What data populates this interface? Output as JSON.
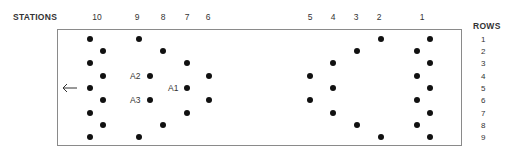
{
  "header": {
    "stations_label": "STATIONS",
    "rows_label": "ROWS"
  },
  "stations": [
    {
      "label": "10",
      "x": 97
    },
    {
      "label": "9",
      "x": 137
    },
    {
      "label": "8",
      "x": 163
    },
    {
      "label": "7",
      "x": 187
    },
    {
      "label": "6",
      "x": 208
    },
    {
      "label": "5",
      "x": 310
    },
    {
      "label": "4",
      "x": 333
    },
    {
      "label": "3",
      "x": 356
    },
    {
      "label": "2",
      "x": 379
    },
    {
      "label": "1",
      "x": 422
    }
  ],
  "rows": [
    {
      "label": "1",
      "y": 39
    },
    {
      "label": "2",
      "y": 51
    },
    {
      "label": "3",
      "y": 63
    },
    {
      "label": "4",
      "y": 76
    },
    {
      "label": "5",
      "y": 88
    },
    {
      "label": "6",
      "y": 100
    },
    {
      "label": "7",
      "y": 113
    },
    {
      "label": "8",
      "y": 125
    },
    {
      "label": "9",
      "y": 137
    }
  ],
  "annotations": [
    {
      "label": "A2",
      "x": 130,
      "y": 76
    },
    {
      "label": "A1",
      "x": 168,
      "y": 88
    },
    {
      "label": "A3",
      "x": 130,
      "y": 100
    }
  ],
  "arrow": {
    "icon": "left-arrow-icon",
    "glyph": "←"
  },
  "dots": [
    {
      "station": "10",
      "row": 1,
      "x": 90,
      "y": 39
    },
    {
      "station": "10",
      "row": 2,
      "x": 103,
      "y": 51
    },
    {
      "station": "10",
      "row": 3,
      "x": 90,
      "y": 63
    },
    {
      "station": "10",
      "row": 4,
      "x": 103,
      "y": 76
    },
    {
      "station": "10",
      "row": 5,
      "x": 90,
      "y": 88
    },
    {
      "station": "10",
      "row": 6,
      "x": 103,
      "y": 100
    },
    {
      "station": "10",
      "row": 7,
      "x": 90,
      "y": 113
    },
    {
      "station": "10",
      "row": 8,
      "x": 103,
      "y": 125
    },
    {
      "station": "10",
      "row": 9,
      "x": 90,
      "y": 137
    },
    {
      "station": "9",
      "row": 1,
      "x": 139,
      "y": 39
    },
    {
      "station": "9",
      "row": 9,
      "x": 139,
      "y": 137
    },
    {
      "station": "8",
      "row": 2,
      "x": 163,
      "y": 51
    },
    {
      "station": "8",
      "row": 4,
      "x": 150,
      "y": 76,
      "label": "A2"
    },
    {
      "station": "8",
      "row": 6,
      "x": 150,
      "y": 100,
      "label": "A3"
    },
    {
      "station": "8",
      "row": 8,
      "x": 163,
      "y": 125
    },
    {
      "station": "7",
      "row": 3,
      "x": 187,
      "y": 63
    },
    {
      "station": "7",
      "row": 5,
      "x": 187,
      "y": 88,
      "label": "A1"
    },
    {
      "station": "7",
      "row": 7,
      "x": 187,
      "y": 113
    },
    {
      "station": "6",
      "row": 4,
      "x": 209,
      "y": 76
    },
    {
      "station": "6",
      "row": 6,
      "x": 209,
      "y": 100
    },
    {
      "station": "5",
      "row": 4,
      "x": 310,
      "y": 76
    },
    {
      "station": "5",
      "row": 6,
      "x": 310,
      "y": 100
    },
    {
      "station": "4",
      "row": 3,
      "x": 333,
      "y": 63
    },
    {
      "station": "4",
      "row": 5,
      "x": 333,
      "y": 88
    },
    {
      "station": "4",
      "row": 7,
      "x": 333,
      "y": 113
    },
    {
      "station": "3",
      "row": 2,
      "x": 357,
      "y": 51
    },
    {
      "station": "3",
      "row": 8,
      "x": 357,
      "y": 125
    },
    {
      "station": "2",
      "row": 1,
      "x": 381,
      "y": 39
    },
    {
      "station": "2",
      "row": 9,
      "x": 381,
      "y": 137
    },
    {
      "station": "1",
      "row": 1,
      "x": 430,
      "y": 39
    },
    {
      "station": "1",
      "row": 2,
      "x": 417,
      "y": 51
    },
    {
      "station": "1",
      "row": 3,
      "x": 430,
      "y": 63
    },
    {
      "station": "1",
      "row": 4,
      "x": 417,
      "y": 76
    },
    {
      "station": "1",
      "row": 5,
      "x": 430,
      "y": 88
    },
    {
      "station": "1",
      "row": 6,
      "x": 417,
      "y": 100
    },
    {
      "station": "1",
      "row": 7,
      "x": 430,
      "y": 113
    },
    {
      "station": "1",
      "row": 8,
      "x": 417,
      "y": 125
    },
    {
      "station": "1",
      "row": 9,
      "x": 430,
      "y": 137
    }
  ]
}
